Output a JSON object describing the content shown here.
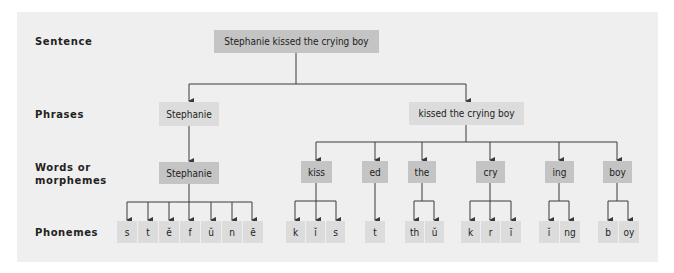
{
  "levels": {
    "sentence": "Sentence",
    "phrases": "Phrases",
    "words_line1": "Words or",
    "words_line2": "morphemes",
    "phonemes": "Phonemes"
  },
  "sentence": {
    "text": "Stephanie kissed the crying boy"
  },
  "phrases": [
    {
      "text": "Stephanie"
    },
    {
      "text": "kissed the crying boy"
    }
  ],
  "morphemes": [
    {
      "text": "Stephanie",
      "phonemes": [
        "s",
        "t",
        "ĕ",
        "f",
        "ŭ",
        "n",
        "ē"
      ]
    },
    {
      "text": "kiss",
      "phonemes": [
        "k",
        "ĭ",
        "s"
      ]
    },
    {
      "text": "ed",
      "phonemes": [
        "t"
      ]
    },
    {
      "text": "the",
      "phonemes": [
        "th",
        "ŭ"
      ]
    },
    {
      "text": "cry",
      "phonemes": [
        "k",
        "r",
        "ī"
      ]
    },
    {
      "text": "ing",
      "phonemes": [
        "ĭ",
        "ng"
      ]
    },
    {
      "text": "boy",
      "phonemes": [
        "b",
        "oy"
      ]
    }
  ],
  "colors": {
    "panel": "#efefef",
    "node_dark": "#c4c4c4",
    "node_light": "#dcdcdc",
    "line": "#3a3a3a"
  }
}
